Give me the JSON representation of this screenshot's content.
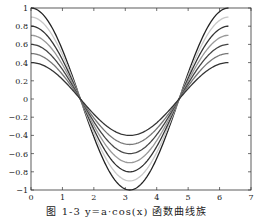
{
  "chart_data": {
    "type": "line",
    "title": "",
    "caption": "图 1-3 y=a·cos(x) 函数曲线族",
    "xlabel": "",
    "ylabel": "",
    "xlim": [
      0,
      7
    ],
    "ylim": [
      -1,
      1
    ],
    "grid": false,
    "legend": "none",
    "x_ticks": [
      0,
      1,
      2,
      3,
      4,
      5,
      6,
      7
    ],
    "x_tick_labels": [
      "0",
      "1",
      "2",
      "3",
      "4",
      "5",
      "6",
      "7"
    ],
    "y_ticks": [
      1,
      0.8,
      0.6,
      0.4,
      0.2,
      0,
      -0.2,
      -0.4,
      -0.6,
      -0.8,
      -1
    ],
    "y_tick_labels": [
      "1",
      "0.8",
      "0.6",
      "0.4",
      "0.2",
      "0",
      "−0.2",
      "−0.4",
      "−0.6",
      "−0.8",
      "−1"
    ],
    "x_range": [
      0,
      6.2832
    ],
    "function": "y = a * cos(x)",
    "series": [
      {
        "name": "a=1.0",
        "amplitude": 1.0,
        "color": "#222222"
      },
      {
        "name": "a=0.9",
        "amplitude": 0.9,
        "color": "#c8c8c8"
      },
      {
        "name": "a=0.8",
        "amplitude": 0.8,
        "color": "#333333"
      },
      {
        "name": "a=0.7",
        "amplitude": 0.7,
        "color": "#999999"
      },
      {
        "name": "a=0.6",
        "amplitude": 0.6,
        "color": "#444444"
      },
      {
        "name": "a=0.5",
        "amplitude": 0.5,
        "color": "#777777"
      },
      {
        "name": "a=0.4",
        "amplitude": 0.4,
        "color": "#333333"
      }
    ]
  },
  "layout": {
    "plot_left": 31,
    "plot_right": 251,
    "plot_top": 8,
    "plot_bottom": 190
  }
}
